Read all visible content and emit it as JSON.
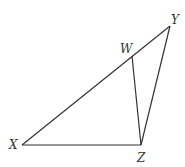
{
  "diagram": {
    "type": "triangle",
    "stroke_color": "#333333",
    "points": {
      "X": {
        "x": 22,
        "y": 145
      },
      "Y": {
        "x": 170,
        "y": 26
      },
      "Z": {
        "x": 141,
        "y": 145
      },
      "W": {
        "x": 132,
        "y": 56
      }
    },
    "segments": [
      {
        "from": "X",
        "to": "Y"
      },
      {
        "from": "Y",
        "to": "Z"
      },
      {
        "from": "Z",
        "to": "X"
      },
      {
        "from": "W",
        "to": "Z"
      }
    ],
    "labels": {
      "X": "X",
      "Y": "Y",
      "Z": "Z",
      "W": "W"
    }
  }
}
